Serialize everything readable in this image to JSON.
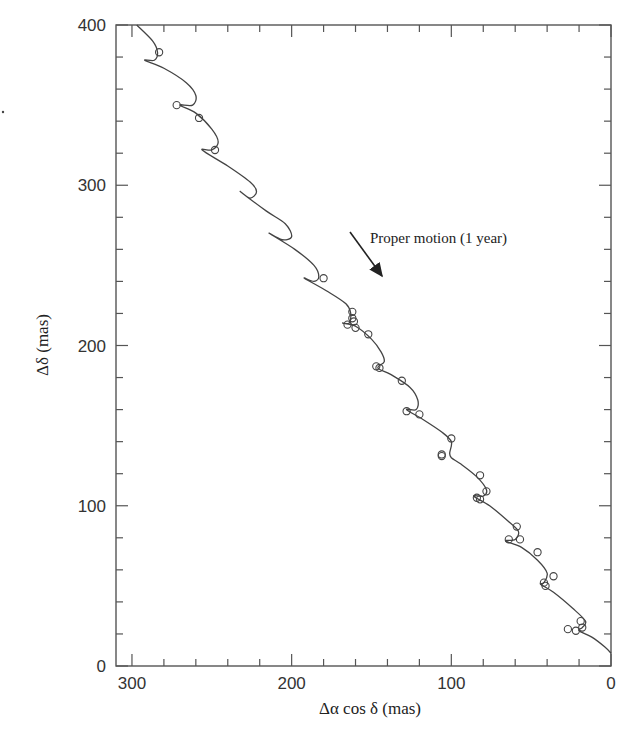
{
  "chart_data": {
    "type": "line",
    "title": "",
    "xlabel": "Δα cos δ  (mas)",
    "ylabel": "Δδ  (mas)",
    "xlim": [
      310,
      0
    ],
    "ylim": [
      0,
      400
    ],
    "x_reversed": true,
    "x_ticks": [
      300,
      200,
      100,
      0
    ],
    "y_ticks": [
      0,
      100,
      200,
      300,
      400
    ],
    "x_minor_step": 20,
    "y_minor_step": 20,
    "grid": false,
    "legend": null,
    "annotations": [
      {
        "text": "Proper motion (1 year)",
        "type": "arrow",
        "from": [
          163,
          270
        ],
        "to": [
          143,
          242
        ]
      }
    ],
    "series": [
      {
        "name": "Parallax + proper motion fit",
        "style": "line",
        "description": "Looping curve (proper motion trend with annual parallax wiggles), descending from top-left (~297, 400) to bottom-right (0, ~10)",
        "points": [
          [
            297,
            400
          ],
          [
            287,
            390
          ],
          [
            284,
            383
          ],
          [
            286,
            378
          ],
          [
            292,
            378
          ],
          [
            280,
            373
          ],
          [
            266,
            364
          ],
          [
            260,
            356
          ],
          [
            262,
            350
          ],
          [
            270,
            350
          ],
          [
            260,
            345
          ],
          [
            250,
            335
          ],
          [
            246,
            327
          ],
          [
            250,
            322
          ],
          [
            256,
            322
          ],
          [
            240,
            312
          ],
          [
            226,
            302
          ],
          [
            222,
            296
          ],
          [
            226,
            292
          ],
          [
            232,
            296
          ],
          [
            216,
            284
          ],
          [
            204,
            276
          ],
          [
            200,
            268
          ],
          [
            206,
            266
          ],
          [
            214,
            270
          ],
          [
            198,
            260
          ],
          [
            186,
            250
          ],
          [
            183,
            243
          ],
          [
            186,
            240
          ],
          [
            192,
            242
          ],
          [
            178,
            234
          ],
          [
            166,
            226
          ],
          [
            163,
            220
          ],
          [
            164,
            214
          ],
          [
            168,
            214
          ],
          [
            160,
            212
          ],
          [
            150,
            204
          ],
          [
            144,
            196
          ],
          [
            142,
            190
          ],
          [
            146,
            186
          ],
          [
            138,
            182
          ],
          [
            126,
            174
          ],
          [
            121,
            166
          ],
          [
            122,
            160
          ],
          [
            128,
            160
          ],
          [
            118,
            154
          ],
          [
            106,
            146
          ],
          [
            100,
            140
          ],
          [
            101,
            133
          ],
          [
            100,
            130
          ],
          [
            94,
            126
          ],
          [
            84,
            118
          ],
          [
            78,
            110
          ],
          [
            80,
            106
          ],
          [
            86,
            106
          ],
          [
            76,
            100
          ],
          [
            64,
            90
          ],
          [
            58,
            84
          ],
          [
            60,
            79
          ],
          [
            66,
            78
          ],
          [
            56,
            74
          ],
          [
            46,
            66
          ],
          [
            40,
            58
          ],
          [
            42,
            52
          ],
          [
            44,
            51
          ],
          [
            36,
            46
          ],
          [
            24,
            36
          ],
          [
            16,
            28
          ],
          [
            18,
            24
          ],
          [
            20,
            22
          ],
          [
            12,
            18
          ],
          [
            4,
            12
          ],
          [
            0,
            8
          ]
        ]
      },
      {
        "name": "Observations",
        "style": "scatter",
        "marker": "open-circle",
        "points": [
          [
            283,
            383
          ],
          [
            272,
            350
          ],
          [
            258,
            342
          ],
          [
            248,
            322
          ],
          [
            180,
            242
          ],
          [
            162,
            221
          ],
          [
            162,
            217
          ],
          [
            161,
            215
          ],
          [
            165,
            213
          ],
          [
            160,
            211
          ],
          [
            152,
            207
          ],
          [
            147,
            187
          ],
          [
            145,
            186
          ],
          [
            131,
            178
          ],
          [
            128,
            159
          ],
          [
            120,
            157
          ],
          [
            100,
            142
          ],
          [
            106,
            132
          ],
          [
            106,
            131
          ],
          [
            82,
            119
          ],
          [
            78,
            109
          ],
          [
            84,
            105
          ],
          [
            82,
            104
          ],
          [
            59,
            87
          ],
          [
            64,
            79
          ],
          [
            57,
            79
          ],
          [
            46,
            71
          ],
          [
            36,
            56
          ],
          [
            42,
            52
          ],
          [
            41,
            50
          ],
          [
            19,
            28
          ],
          [
            18,
            24
          ],
          [
            27,
            23
          ],
          [
            22,
            22
          ]
        ]
      }
    ]
  }
}
